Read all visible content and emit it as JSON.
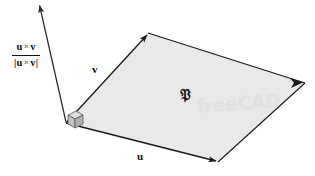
{
  "figure": {
    "width": 315,
    "height": 176,
    "background_color": "#ffffff"
  },
  "colors": {
    "plane_fill": "#e9e9e9",
    "plane_stroke": "#1a1a1a",
    "vector_stroke": "#2b2b2b",
    "cube_fill": "#c9c9c9",
    "cube_fill_light": "#dddddd",
    "cube_fill_dark": "#b3b3b3",
    "label_color": "#111111",
    "watermark_color": "#e2e2e2"
  },
  "labels": {
    "vector_u": "u",
    "vector_v": "v",
    "region": "𝔓",
    "unit_normal": {
      "numerator_left": "u",
      "numerator_op": "×",
      "numerator_right": "v",
      "denominator_left": "|u",
      "denominator_op": "×",
      "denominator_right": "v|"
    }
  },
  "watermark": {
    "text": "freeCAD"
  },
  "geometry": {
    "origin_vertex": [
      66,
      123
    ],
    "u_tip_vertex": [
      218,
      162
    ],
    "v_tip_vertex": [
      148,
      33
    ],
    "opposite_vertex": [
      305,
      83
    ],
    "normal_arrow_start": [
      66,
      123
    ],
    "normal_arrow_tip": [
      38,
      3
    ],
    "right_angle_cube_center": [
      75,
      116
    ],
    "right_angle_cube_size": 9
  },
  "annotations": {
    "plane_name": "P",
    "normal_description": "unit normal vector u cross v divided by magnitude of u cross v",
    "right_angle_marker": "cube"
  }
}
